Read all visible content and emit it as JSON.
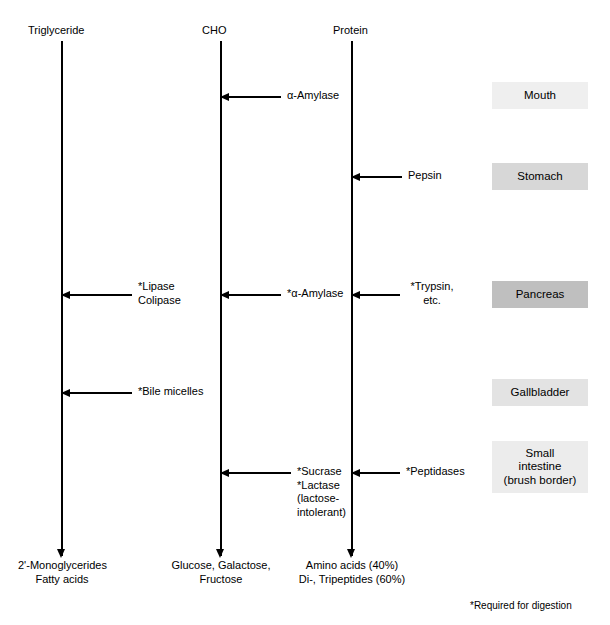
{
  "diagram": {
    "footnote": "*Required for digestion"
  },
  "columns": [
    {
      "id": "triglyceride",
      "label": "Triglyceride"
    },
    {
      "id": "cho",
      "label": "CHO"
    },
    {
      "id": "protein",
      "label": "Protein"
    }
  ],
  "enzymes": [
    {
      "id": "alpha-amylase-mouth",
      "label": "α-Amylase",
      "target": "cho",
      "site": "mouth"
    },
    {
      "id": "pepsin",
      "label": "Pepsin",
      "target": "protein",
      "site": "stomach"
    },
    {
      "id": "lipase-colipase",
      "label": "*Lipase\nColipase",
      "line1": "*Lipase",
      "line2": "Colipase",
      "target": "triglyceride",
      "site": "pancreas"
    },
    {
      "id": "alpha-amylase-pancreas",
      "label": "*α-Amylase",
      "target": "cho",
      "site": "pancreas"
    },
    {
      "id": "trypsin",
      "label": "*Trypsin,\netc.",
      "line1": "*Trypsin,",
      "line2": "etc.",
      "target": "protein",
      "site": "pancreas"
    },
    {
      "id": "bile-micelles",
      "label": "*Bile micelles",
      "target": "triglyceride",
      "site": "gallbladder"
    },
    {
      "id": "sucrase-lactase",
      "label": "*Sucrase\n*Lactase\n(lactose-\nintolerant)",
      "line1": "*Sucrase",
      "line2": "*Lactase",
      "line3": "(lactose-",
      "line4": "intolerant)",
      "target": "cho",
      "site": "small-intestine"
    },
    {
      "id": "peptidases",
      "label": "*Peptidases",
      "target": "protein",
      "site": "small-intestine"
    }
  ],
  "organs": [
    {
      "id": "mouth",
      "label": "Mouth",
      "color": "#efefef"
    },
    {
      "id": "stomach",
      "label": "Stomach",
      "color": "#d7d7d7"
    },
    {
      "id": "pancreas",
      "label": "Pancreas",
      "color": "#bfbfbf"
    },
    {
      "id": "gallbladder",
      "label": "Gallbladder",
      "color": "#e3e3e3"
    },
    {
      "id": "small-intestine",
      "label": "Small\nintestine\n(brush border)",
      "line1": "Small",
      "line2": "intestine",
      "line3": "(brush border)",
      "color": "#ececec"
    }
  ],
  "products": [
    {
      "id": "triglyceride-products",
      "line1": "2'-Monoglycerides",
      "line2": "Fatty acids"
    },
    {
      "id": "cho-products",
      "line1": "Glucose, Galactose,",
      "line2": "Fructose"
    },
    {
      "id": "protein-products",
      "line1": "Amino acids (40%)",
      "line2": "Di-, Tripeptides (60%)"
    }
  ]
}
